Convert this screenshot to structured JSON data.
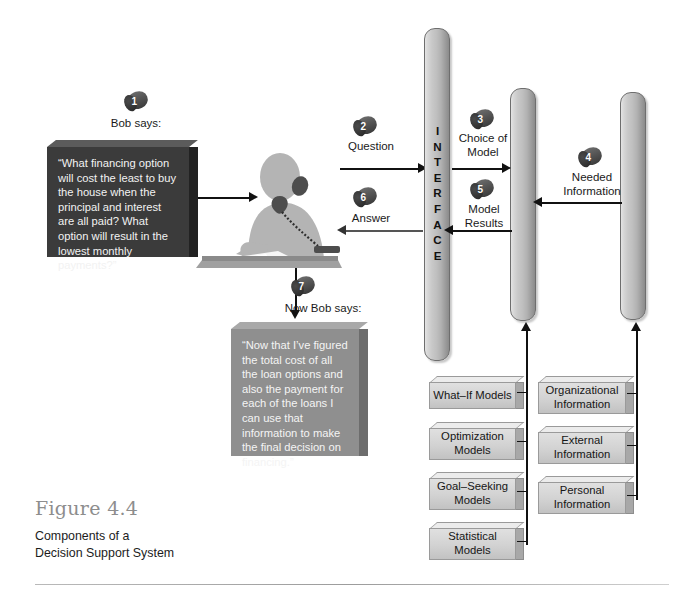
{
  "figure": {
    "number": "Figure 4.4",
    "caption": "Components of a\nDecision Support System"
  },
  "actor": {
    "name": "bob-at-desk",
    "description": "person on telephone at desk"
  },
  "steps": [
    {
      "num": "1",
      "label": "Bob says:"
    },
    {
      "num": "2",
      "label": "Question"
    },
    {
      "num": "3",
      "label": "Choice of\nModel"
    },
    {
      "num": "4",
      "label": "Needed\nInformation"
    },
    {
      "num": "5",
      "label": "Model\nResults"
    },
    {
      "num": "6",
      "label": "Answer"
    },
    {
      "num": "7",
      "label": "Now Bob says:"
    }
  ],
  "quotes": [
    {
      "id": "bob-question",
      "text": "“What financing option will cost the least to buy the house when the principal and interest are all paid? What option will result in the lowest monthly payments?”"
    },
    {
      "id": "bob-conclusion",
      "text": "“Now that I’ve figured the total cost of all the loan options and also the payment for each of the loans I can use that information to make the final decision on financing.”"
    }
  ],
  "pillars": [
    {
      "id": "user-interface-management",
      "text": "USER\n\nINTERFACE\n\nMANAGEMENT"
    },
    {
      "id": "model-management",
      "text": "MODEL\n\nMANAGEMENT"
    },
    {
      "id": "data-management",
      "text": "DATA\n\nMANAGEMENT"
    }
  ],
  "model_boxes": [
    {
      "id": "what-if-models",
      "label": "What–If Models"
    },
    {
      "id": "optimization-models",
      "label": "Optimization\nModels"
    },
    {
      "id": "goal-seeking-models",
      "label": "Goal–Seeking\nModels"
    },
    {
      "id": "statistical-models",
      "label": "Statistical\nModels"
    }
  ],
  "data_boxes": [
    {
      "id": "organizational-information",
      "label": "Organizational\nInformation"
    },
    {
      "id": "external-information",
      "label": "External\nInformation"
    },
    {
      "id": "personal-information",
      "label": "Personal\nInformation"
    }
  ],
  "colors": {
    "quote_dark": "#3b3b3b",
    "quote_gray": "#8f8f8f",
    "pillar_light": "#e4e4e4",
    "pillar_dark": "#8b8b8b",
    "box_fill": "#d2d2d2",
    "line": "#111111",
    "figure_number": "#8d8d8d"
  }
}
